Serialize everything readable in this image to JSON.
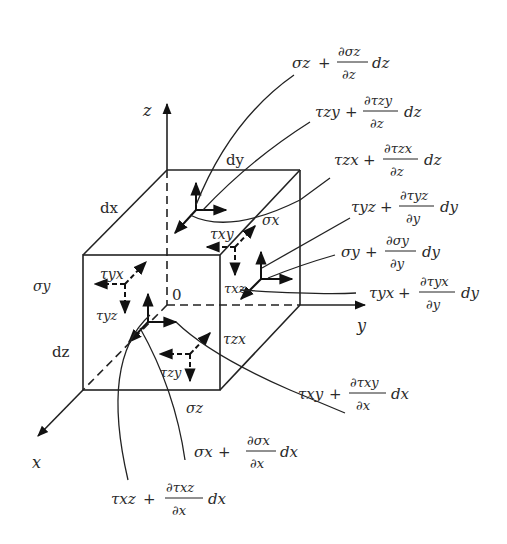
{
  "figure": {
    "axes": {
      "x": "x",
      "y": "y",
      "z": "z",
      "origin": "0"
    },
    "dimensions": {
      "dx": "dx",
      "dy": "dy",
      "dz": "dz"
    },
    "near_face_labels": {
      "sigma_y": "σy",
      "tau_yx": "τyx",
      "tau_yz": "τyz",
      "tau_xy": "τxy",
      "tau_xz": "τxz",
      "sigma_x": "σx",
      "tau_zx": "τzx",
      "tau_zy": "τzy",
      "sigma_z": "σz"
    },
    "increment_labels": [
      {
        "id": "sigma_z_dz",
        "base": "σz",
        "num": "∂σz",
        "den": "∂z",
        "d": "dz"
      },
      {
        "id": "tau_zy_dz",
        "base": "τzy",
        "num": "∂τzy",
        "den": "∂z",
        "d": "dz"
      },
      {
        "id": "tau_zx_dz",
        "base": "τzx",
        "num": "∂τzx",
        "den": "∂z",
        "d": "dz"
      },
      {
        "id": "tau_yz_dy",
        "base": "τyz",
        "num": "∂τyz",
        "den": "∂y",
        "d": "dy"
      },
      {
        "id": "sigma_y_dy",
        "base": "σy",
        "num": "∂σy",
        "den": "∂y",
        "d": "dy"
      },
      {
        "id": "tau_yx_dy",
        "base": "τyx",
        "num": "∂τyx",
        "den": "∂y",
        "d": "dy"
      },
      {
        "id": "tau_xy_dx",
        "base": "τxy",
        "num": "∂τxy",
        "den": "∂x",
        "d": "dx"
      },
      {
        "id": "sigma_x_dx",
        "base": "σx",
        "num": "∂σx",
        "den": "∂x",
        "d": "dx"
      },
      {
        "id": "tau_xz_dx",
        "base": "τxz",
        "num": "∂τxz",
        "den": "∂x",
        "d": "dx"
      }
    ],
    "plus": "+"
  }
}
